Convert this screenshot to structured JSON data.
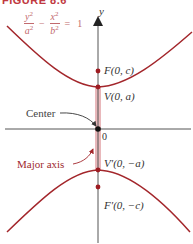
{
  "caption": "FIGURE 8.6",
  "equation": {
    "term1_num": "y",
    "term1_den": "a",
    "minus": "−",
    "term2_num": "x",
    "term2_den": "b",
    "equals": "=",
    "rhs": "1",
    "exponent": "2"
  },
  "axes": {
    "y_label": "y",
    "origin_label": "0"
  },
  "points": {
    "focus_top": "F(0, c)",
    "vertex_top": "V(0, a)",
    "vertex_bottom": "V′(0, −a)",
    "focus_bottom": "F′(0, −c)"
  },
  "annotations": {
    "center": "Center",
    "major_axis": "Major axis"
  },
  "colors": {
    "curve": "#a3262b",
    "major_axis_band": "#e9b8bb",
    "axis": "#555555",
    "point": "#9e1c22",
    "annotation_major": "#9e2a2f",
    "annotation_center": "#444444"
  }
}
